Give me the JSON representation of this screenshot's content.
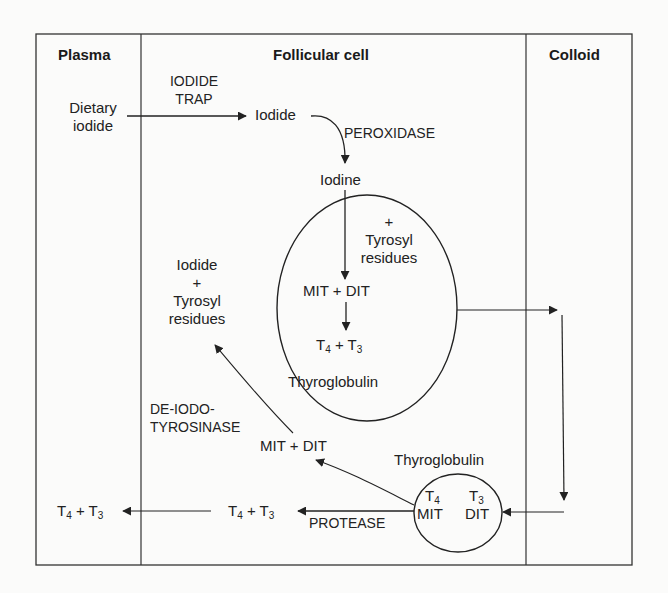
{
  "columns": {
    "plasma": "Plasma",
    "follicular_cell": "Follicular cell",
    "colloid": "Colloid"
  },
  "nodes": {
    "dietary_iodide_1": "Dietary",
    "dietary_iodide_2": "iodide",
    "iodide": "Iodide",
    "iodine": "Iodine",
    "plus_tyrosyl_plus": "+",
    "plus_tyrosyl_1": "Tyrosyl",
    "plus_tyrosyl_2": "residues",
    "mit_dit_inner": "MIT + DIT",
    "t4_t3_inner_t": "T",
    "t4_t3_inner_4": "4",
    "t4_t3_inner_plus": " + T",
    "t4_t3_inner_3": "3",
    "thyroglobulin_large": "Thyroglobulin",
    "recycled_iodide": "Iodide",
    "recycled_plus": "+",
    "recycled_tyrosyl": "Tyrosyl",
    "recycled_residues": "residues",
    "mit_dit_released": "MIT + DIT",
    "thyroglobulin_small": "Thyroglobulin",
    "small_t4_t": "T",
    "small_t4_sub": "4",
    "small_t3_t": "T",
    "small_t3_sub": "3",
    "small_mit": "MIT",
    "small_dit": "DIT",
    "cell_t4t3_t": "T",
    "cell_t4t3_4": "4",
    "cell_t4t3_plus": " + T",
    "cell_t4t3_3": "3",
    "plasma_t4t3_t": "T",
    "plasma_t4t3_4": "4",
    "plasma_t4t3_plus": " + T",
    "plasma_t4t3_3": "3"
  },
  "enzymes": {
    "iodide_trap_1": "IODIDE",
    "iodide_trap_2": "TRAP",
    "peroxidase": "PEROXIDASE",
    "deiodotyrosinase_1": "DE-IODO-",
    "deiodotyrosinase_2": "TYROSINASE",
    "protease": "PROTEASE"
  },
  "colors": {
    "line": "#2a2a2a",
    "background": "#fbfbfa"
  }
}
